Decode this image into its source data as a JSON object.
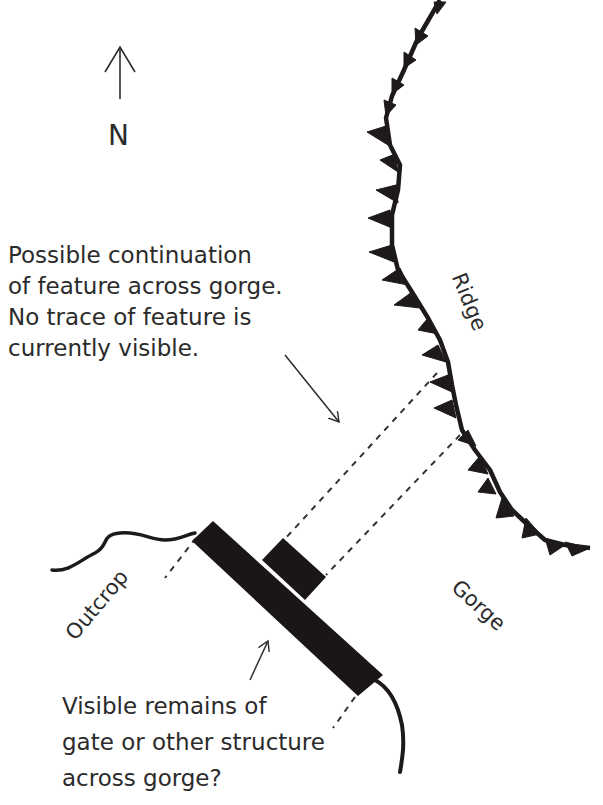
{
  "compass": {
    "letter": "N",
    "arrow": "north-arrow"
  },
  "labels": {
    "ridge": "Ridge",
    "gorge": "Gorge",
    "outcrop": "Outcrop"
  },
  "annotations": {
    "continuation": [
      "Possible continuation",
      "of feature across gorge.",
      "No trace of feature is",
      "currently visible."
    ],
    "remains": [
      "Visible remains of",
      "gate or other structure",
      "across gorge?"
    ]
  },
  "colors": {
    "ink": "#1e1a1a",
    "text": "#2b2b2b",
    "background": "#ffffff"
  }
}
